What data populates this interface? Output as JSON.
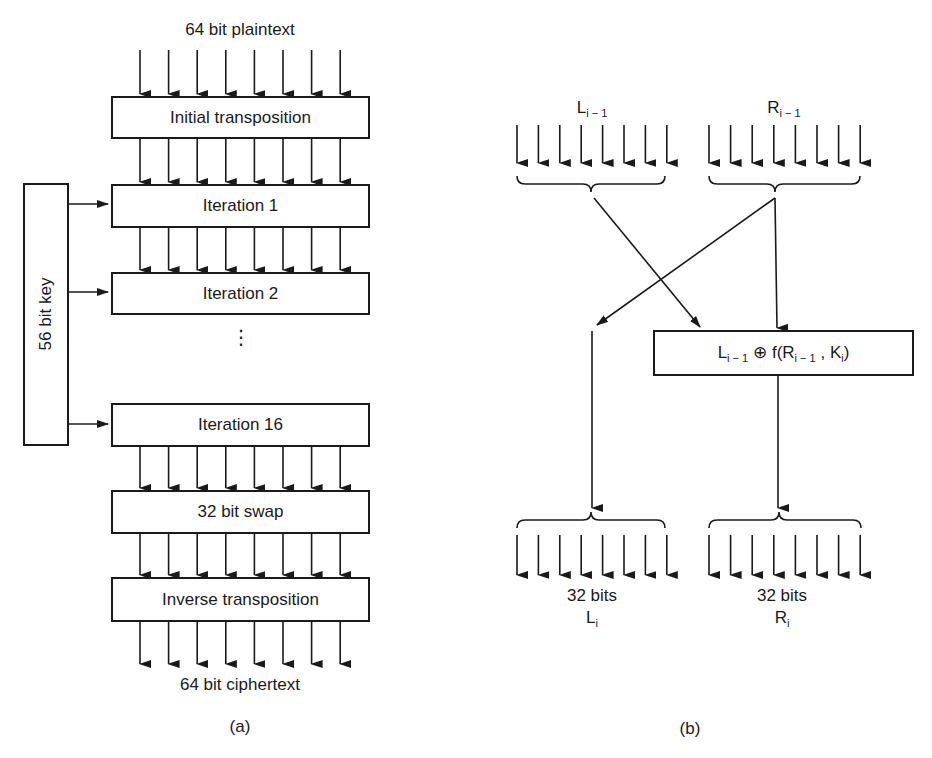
{
  "figure_a": {
    "caption": "(a)",
    "input_label": "64 bit plaintext",
    "output_label": "64 bit ciphertext",
    "key_label": "56 bit key",
    "stages": [
      {
        "label": "Initial transposition"
      },
      {
        "label": "Iteration 1"
      },
      {
        "label": "Iteration 2"
      },
      {
        "label": "Iteration 16"
      },
      {
        "label": "32 bit swap"
      },
      {
        "label": "Inverse transposition"
      }
    ],
    "ellipsis": "⋮",
    "arrows_per_bus": 8
  },
  "figure_b": {
    "caption": "(b)",
    "left_input": {
      "base": "L",
      "sub": "i − 1"
    },
    "right_input": {
      "base": "R",
      "sub": "i − 1"
    },
    "function_box": {
      "l_base": "L",
      "l_sub": "i − 1",
      "op": "⊕",
      "f_open": "f(R",
      "r_sub": "i − 1",
      "comma": " , K",
      "k_sub": "i",
      "close": ")"
    },
    "left_output": {
      "bits": "32 bits",
      "base": "L",
      "sub": "i"
    },
    "right_output": {
      "bits": "32 bits",
      "base": "R",
      "sub": "i"
    },
    "arrows_per_bus": 8
  }
}
